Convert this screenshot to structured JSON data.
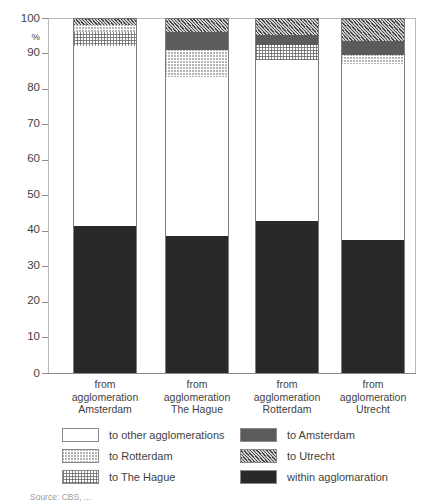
{
  "chart_data": {
    "type": "bar",
    "subtype": "stacked-percentage-column",
    "title": "",
    "subtitle": "",
    "xlabel": "",
    "ylabel": "%",
    "ylim": [
      0,
      100
    ],
    "ytick_values": [
      0,
      10,
      20,
      30,
      40,
      50,
      60,
      70,
      80,
      90,
      100
    ],
    "ytick_labels": [
      "0",
      "10",
      "20",
      "30",
      "40",
      "50",
      "60",
      "70",
      "80",
      "90",
      "100"
    ],
    "grid": false,
    "legend_position": "below",
    "stack_order_bottom_to_top": [
      "within agglomeration",
      "to other agglomerations",
      "to The Hague",
      "to Rotterdam",
      "to Amsterdam",
      "to Utrecht"
    ],
    "categories": [
      "from agglomeration Amsterdam",
      "from agglomeration The Hague",
      "from agglomeration Rotterdam",
      "from agglomeration Utrecht"
    ],
    "series": [
      {
        "name": "within agglomeration",
        "pattern": "dark-dense-checker",
        "values": [
          41.4,
          38.5,
          42.8,
          37.5
        ]
      },
      {
        "name": "to other agglomerations",
        "pattern": "white",
        "values": [
          50.6,
          45.0,
          45.5,
          49.5
        ]
      },
      {
        "name": "to The Hague",
        "pattern": "fine-stipple",
        "values": [
          4.0,
          0.0,
          4.0,
          0.0
        ]
      },
      {
        "name": "to Rotterdam",
        "pattern": "light-hatch",
        "values": [
          2.0,
          7.5,
          0.0,
          2.5
        ]
      },
      {
        "name": "to Amsterdam",
        "pattern": "medium-crosshatch",
        "values": [
          0.0,
          5.0,
          3.0,
          4.0
        ]
      },
      {
        "name": "to Utrecht",
        "pattern": "diagonal-hatch",
        "values": [
          2.0,
          4.0,
          4.7,
          6.5
        ]
      }
    ]
  },
  "axis": {
    "unit_label": "%"
  },
  "categories_multiline": [
    {
      "line1": "from",
      "line2": "agglomeration",
      "line3": "Amsterdam"
    },
    {
      "line1": "from",
      "line2": "agglomeration",
      "line3": "The Hague"
    },
    {
      "line1": "from",
      "line2": "agglomeration",
      "line3": "Rotterdam"
    },
    {
      "line1": "from",
      "line2": "agglomeration",
      "line3": "Utrecht"
    }
  ],
  "legend": {
    "column_left": [
      {
        "label": "to other agglomerations",
        "pattern": "white"
      },
      {
        "label": "to Rotterdam",
        "pattern": "light-hatch"
      },
      {
        "label": "to The Hague",
        "pattern": "fine-stipple"
      }
    ],
    "column_right": [
      {
        "label": "to Amsterdam",
        "pattern": "medium-crosshatch"
      },
      {
        "label": "to Utrecht",
        "pattern": "diagonal-hatch"
      },
      {
        "label": "within agglomaration",
        "pattern": "dark-dense-checker"
      }
    ]
  },
  "source_note": "Source: CBS, ...",
  "colors": {
    "axis": "#8a8a8a",
    "frame": "#b9b9b9",
    "text": "#3f3f3f",
    "bar_outline": "#7d7d7d",
    "within_fill": "#8c8c8c",
    "amsterdam_fill": "#d8d8d8",
    "utrecht_fill": "#cfcfcf",
    "background": "#ffffff"
  }
}
